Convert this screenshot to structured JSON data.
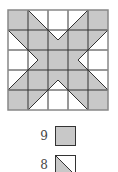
{
  "diagram": {
    "type": "quilt-pattern-grid",
    "rows": 5,
    "cols": 5,
    "colors": {
      "fill": "#c8c8c8",
      "background": "#ffffff",
      "line": "#333333",
      "border": "#888888"
    },
    "cells": [
      [
        "full",
        "half-ll-tlbr",
        "empty",
        "half-lr-trbl",
        "full"
      ],
      [
        "half-ur-tlbr",
        "full",
        "quarter-top-white",
        "full",
        "half-ul-trbl"
      ],
      [
        "empty",
        "quarter-left-white",
        "full",
        "quarter-right-white",
        "empty"
      ],
      [
        "half-lr-trbl",
        "full",
        "quarter-bottom-white",
        "full",
        "half-ll-tlbr"
      ],
      [
        "full",
        "half-ul-trbl",
        "empty",
        "half-ur-tlbr",
        "full"
      ]
    ]
  },
  "legend": [
    {
      "count": "9",
      "shape": "full",
      "label": "full gray square"
    },
    {
      "count": "8",
      "shape": "half-ll-tlbr",
      "label": "half-square triangle"
    }
  ]
}
